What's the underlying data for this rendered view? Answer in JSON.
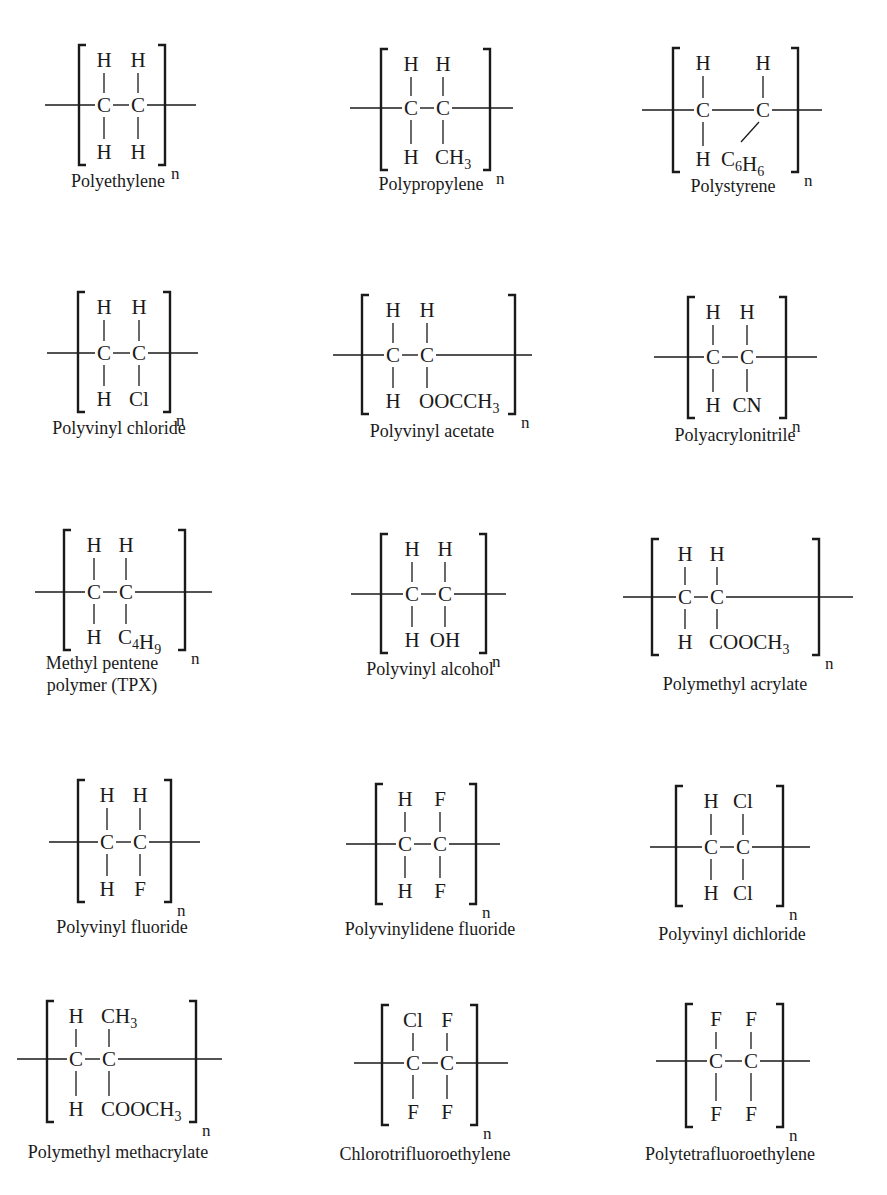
{
  "figure": {
    "repeat_symbol": "n"
  },
  "polymers": [
    {
      "name": "Polyethylene",
      "label_lines": [
        "Polyethylene"
      ],
      "top": [
        "H",
        "H"
      ],
      "bottom": [
        "H",
        "H"
      ]
    },
    {
      "name": "Polypropylene",
      "label_lines": [
        "Polypropylene"
      ],
      "top": [
        "H",
        "H"
      ],
      "bottom": [
        "H",
        "CH3"
      ]
    },
    {
      "name": "Polystyrene",
      "label_lines": [
        "Polystyrene"
      ],
      "top": [
        "H",
        "H"
      ],
      "bottom": [
        "H",
        "C6H6"
      ]
    },
    {
      "name": "Polyvinyl chloride",
      "label_lines": [
        "Polyvinyl chloride"
      ],
      "top": [
        "H",
        "H"
      ],
      "bottom": [
        "H",
        "Cl"
      ]
    },
    {
      "name": "Polyvinyl acetate",
      "label_lines": [
        "Polyvinyl acetate"
      ],
      "top": [
        "H",
        "H"
      ],
      "bottom": [
        "H",
        "OOCCH3"
      ]
    },
    {
      "name": "Polyacrylonitrile",
      "label_lines": [
        "Polyacrylonitrile"
      ],
      "top": [
        "H",
        "H"
      ],
      "bottom": [
        "H",
        "CN"
      ]
    },
    {
      "name": "Methyl pentene polymer (TPX)",
      "label_lines": [
        "Methyl pentene",
        "polymer (TPX)"
      ],
      "top": [
        "H",
        "H"
      ],
      "bottom": [
        "H",
        "C4H9"
      ]
    },
    {
      "name": "Polyvinyl alcohol",
      "label_lines": [
        "Polyvinyl alcohol"
      ],
      "top": [
        "H",
        "H"
      ],
      "bottom": [
        "H",
        "OH"
      ]
    },
    {
      "name": "Polymethyl acrylate",
      "label_lines": [
        "Polymethyl acrylate"
      ],
      "top": [
        "H",
        "H"
      ],
      "bottom": [
        "H",
        "COOCH3"
      ]
    },
    {
      "name": "Polyvinyl fluoride",
      "label_lines": [
        "Polyvinyl fluoride"
      ],
      "top": [
        "H",
        "H"
      ],
      "bottom": [
        "H",
        "F"
      ]
    },
    {
      "name": "Polyvinylidene fluoride",
      "label_lines": [
        "Polyvinylidene fluoride"
      ],
      "top": [
        "H",
        "F"
      ],
      "bottom": [
        "H",
        "F"
      ]
    },
    {
      "name": "Polyvinyl dichloride",
      "label_lines": [
        "Polyvinyl dichloride"
      ],
      "top": [
        "H",
        "Cl"
      ],
      "bottom": [
        "H",
        "Cl"
      ]
    },
    {
      "name": "Polymethyl methacrylate",
      "label_lines": [
        "Polymethyl methacrylate"
      ],
      "top": [
        "H",
        "CH3"
      ],
      "bottom": [
        "H",
        "COOCH3"
      ]
    },
    {
      "name": "Chlorotrifluoroethylene",
      "label_lines": [
        "Chlorotrifluoroethylene"
      ],
      "top": [
        "Cl",
        "F"
      ],
      "bottom": [
        "F",
        "F"
      ]
    },
    {
      "name": "Polytetrafluoroethylene",
      "label_lines": [
        "Polytetrafluoroethylene"
      ],
      "top": [
        "F",
        "F"
      ],
      "bottom": [
        "F",
        "F"
      ]
    }
  ],
  "layout": [
    {
      "bl": 79,
      "br": 165,
      "bt": 45,
      "bb": 165,
      "y": 105,
      "lx1": 45,
      "lx2": 196,
      "c1": 104,
      "c2": 138,
      "ly": 187,
      "lcx": 118,
      "diag": false
    },
    {
      "bl": 381,
      "br": 490,
      "bt": 49,
      "bb": 170,
      "y": 108,
      "lx1": 350,
      "lx2": 513,
      "c1": 411,
      "c2": 443,
      "ly": 190,
      "lcx": 431,
      "diag": false
    },
    {
      "bl": 673,
      "br": 798,
      "bt": 48,
      "bb": 172,
      "y": 110,
      "lx1": 642,
      "lx2": 822,
      "c1": 703,
      "c2": 763,
      "ly": 192,
      "lcx": 733,
      "diag": true
    },
    {
      "bl": 78,
      "br": 170,
      "bt": 292,
      "bb": 412,
      "y": 353,
      "lx1": 47,
      "lx2": 198,
      "c1": 104,
      "c2": 139,
      "ly": 434,
      "lcx": 119,
      "diag": false
    },
    {
      "bl": 362,
      "br": 515,
      "bt": 295,
      "bb": 414,
      "y": 355,
      "lx1": 333,
      "lx2": 532,
      "c1": 393,
      "c2": 427,
      "ly": 437,
      "lcx": 432,
      "diag": false
    },
    {
      "bl": 688,
      "br": 786,
      "bt": 297,
      "bb": 418,
      "y": 357,
      "lx1": 654,
      "lx2": 817,
      "c1": 713,
      "c2": 747,
      "ly": 441,
      "lcx": 735,
      "diag": false
    },
    {
      "bl": 64,
      "br": 185,
      "bt": 530,
      "bb": 650,
      "y": 592,
      "lx1": 35,
      "lx2": 212,
      "c1": 94,
      "c2": 126,
      "ly": 669,
      "lcx": 102,
      "diag": false
    },
    {
      "bl": 381,
      "br": 486,
      "bt": 534,
      "bb": 653,
      "y": 594,
      "lx1": 351,
      "lx2": 506,
      "c1": 412,
      "c2": 445,
      "ly": 675,
      "lcx": 430,
      "diag": false
    },
    {
      "bl": 652,
      "br": 819,
      "bt": 539,
      "bb": 655,
      "y": 597,
      "lx1": 623,
      "lx2": 853,
      "c1": 685,
      "c2": 717,
      "ly": 690,
      "lcx": 735,
      "diag": false
    },
    {
      "bl": 78,
      "br": 171,
      "bt": 780,
      "bb": 902,
      "y": 842,
      "lx1": 49,
      "lx2": 200,
      "c1": 107,
      "c2": 140,
      "ly": 933,
      "lcx": 122,
      "diag": false
    },
    {
      "bl": 376,
      "br": 476,
      "bt": 784,
      "bb": 904,
      "y": 844,
      "lx1": 346,
      "lx2": 500,
      "c1": 405,
      "c2": 440,
      "ly": 935,
      "lcx": 430,
      "diag": false
    },
    {
      "bl": 676,
      "br": 783,
      "bt": 786,
      "bb": 906,
      "y": 847,
      "lx1": 650,
      "lx2": 810,
      "c1": 711,
      "c2": 743,
      "ly": 940,
      "lcx": 732,
      "diag": false
    },
    {
      "bl": 47,
      "br": 196,
      "bt": 1001,
      "bb": 1122,
      "y": 1059,
      "lx1": 17,
      "lx2": 222,
      "c1": 76,
      "c2": 109,
      "ly": 1158,
      "lcx": 118,
      "diag": false
    },
    {
      "bl": 382,
      "br": 477,
      "bt": 1005,
      "bb": 1125,
      "y": 1063,
      "lx1": 354,
      "lx2": 508,
      "c1": 413,
      "c2": 447,
      "ly": 1160,
      "lcx": 425,
      "diag": false
    },
    {
      "bl": 686,
      "br": 783,
      "bt": 1004,
      "bb": 1127,
      "y": 1061,
      "lx1": 656,
      "lx2": 810,
      "c1": 716,
      "c2": 751,
      "ly": 1160,
      "lcx": 730,
      "diag": false
    }
  ],
  "colors": {
    "ink": "#1a1a1a",
    "background": "#ffffff"
  }
}
